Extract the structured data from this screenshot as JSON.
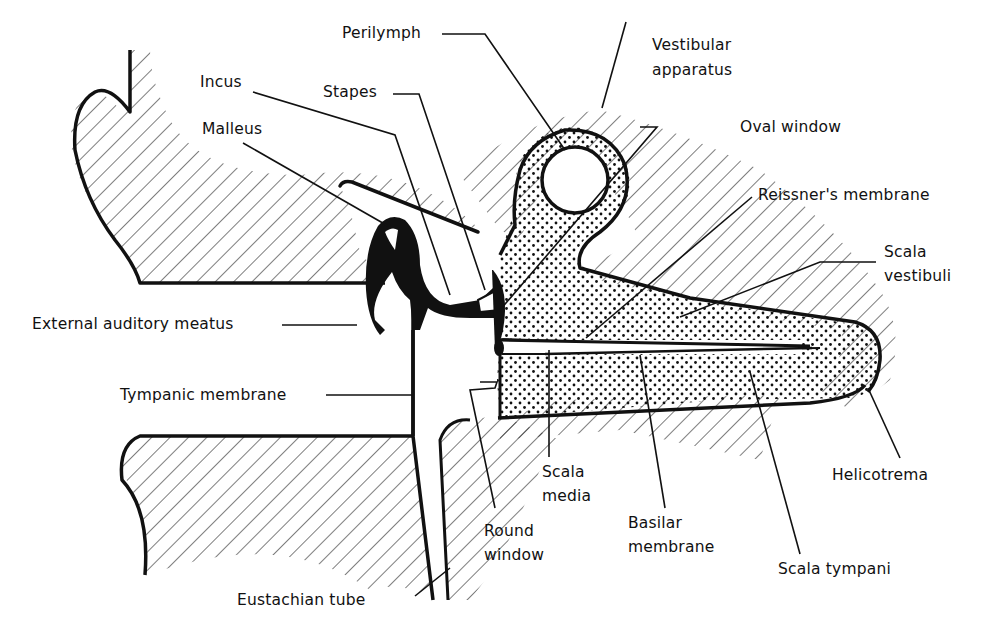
{
  "diagram": {
    "type": "anatomical-cross-section",
    "colors": {
      "ink": "#111111",
      "background": "#ffffff"
    },
    "labels": {
      "perilymph": "Perilymph",
      "vestibular_line1": "Vestibular",
      "vestibular_line2": "apparatus",
      "incus": "Incus",
      "stapes": "Stapes",
      "malleus": "Malleus",
      "oval_window": "Oval window",
      "reissners_membrane": "Reissner's membrane",
      "scala_vestibuli_line1": "Scala",
      "scala_vestibuli_line2": "vestibuli",
      "external_auditory_meatus": "External auditory meatus",
      "tympanic_membrane": "Tympanic membrane",
      "helicotrema": "Helicotrema",
      "scala_media_line1": "Scala",
      "scala_media_line2": "media",
      "round_window_line1": "Round",
      "round_window_line2": "window",
      "basilar_line1": "Basilar",
      "basilar_line2": "membrane",
      "scala_tympani": "Scala tympani",
      "eustachian_tube": "Eustachian tube"
    }
  }
}
